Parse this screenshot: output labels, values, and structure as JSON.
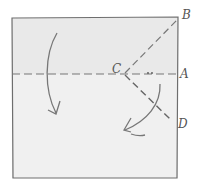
{
  "diagram": {
    "type": "origami-fold-step",
    "colors": {
      "paper": "#ececec",
      "paper_lower": "#f1f1f1",
      "line": "#6e6e6e",
      "background": "#ffffff"
    },
    "labels": {
      "A": "A",
      "B": "B",
      "C": "C",
      "D": "D"
    },
    "elements": [
      "square paper outline",
      "horizontal dashed valley fold line through middle",
      "dashed fold line from C to B",
      "dashed fold line from C to D",
      "curved arrow on left pointing down",
      "curved arrow on right pointing down-left"
    ]
  }
}
